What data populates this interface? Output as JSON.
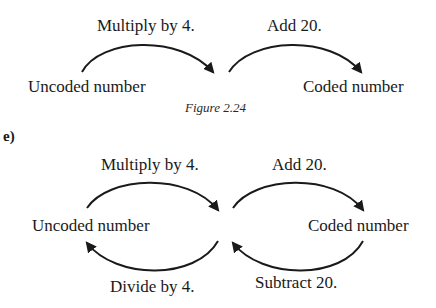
{
  "figure_top": {
    "labels": {
      "op_forward_1": "Multiply by 4.",
      "op_forward_2": "Add 20.",
      "start_node": "Uncoded number",
      "end_node": "Coded number"
    },
    "caption": "Figure 2.24"
  },
  "figure_bottom": {
    "part_label": "e)",
    "labels": {
      "op_forward_1": "Multiply by 4.",
      "op_forward_2": "Add 20.",
      "start_node": "Uncoded number",
      "end_node": "Coded number",
      "op_inverse_1": "Divide by 4.",
      "op_inverse_2": "Subtract 20."
    }
  },
  "colors": {
    "ink": "#1a1a1a",
    "background": "#ffffff"
  }
}
